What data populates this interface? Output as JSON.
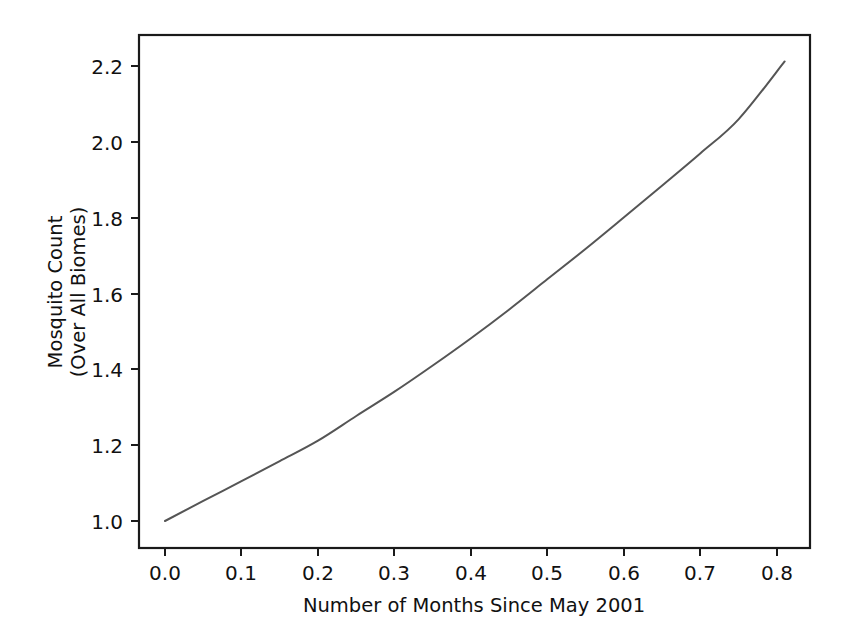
{
  "chart_data": {
    "type": "line",
    "title": "",
    "xlabel": "Number of Months Since May 2001",
    "ylabel": "Mosquito Count\n(Over All Biomes)",
    "ylabel_line1": "Mosquito Count",
    "ylabel_line2": "(Over All Biomes)",
    "xlim": [
      -0.035,
      0.845
    ],
    "ylim": [
      0.955,
      2.26
    ],
    "grid": false,
    "legend": null,
    "line_color": "#555555",
    "axis_color": "#1a1a1a",
    "background_color": "#ffffff",
    "xticks": [
      0.0,
      0.1,
      0.2,
      0.3,
      0.4,
      0.5,
      0.6,
      0.7,
      0.8
    ],
    "xtick_labels": [
      "0.0",
      "0.1",
      "0.2",
      "0.3",
      "0.4",
      "0.5",
      "0.6",
      "0.7",
      "0.8"
    ],
    "yticks": [
      1.0,
      1.2,
      1.4,
      1.6,
      1.8,
      2.0,
      2.2
    ],
    "ytick_labels": [
      "1.0",
      "1.2",
      "1.4",
      "1.6",
      "1.8",
      "2.0",
      "2.2"
    ],
    "series": [
      {
        "name": "mosquito-count",
        "x": [
          0.0,
          0.05,
          0.1,
          0.15,
          0.2,
          0.25,
          0.3,
          0.35,
          0.4,
          0.45,
          0.5,
          0.55,
          0.6,
          0.65,
          0.7,
          0.75,
          0.81
        ],
        "values": [
          1.0,
          1.053,
          1.105,
          1.158,
          1.212,
          1.277,
          1.341,
          1.41,
          1.482,
          1.558,
          1.638,
          1.718,
          1.801,
          1.885,
          1.97,
          2.06,
          2.212
        ]
      }
    ]
  }
}
